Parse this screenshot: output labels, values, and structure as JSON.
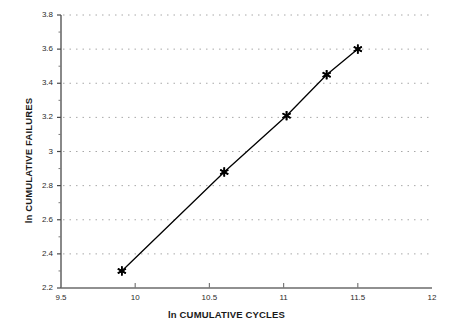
{
  "chart_data": {
    "type": "scatter",
    "title": "",
    "xlabel": "ln CUMULATIVE CYCLES",
    "ylabel": "ln CUMULATIVE FAILURES",
    "xlim": [
      9.5,
      12
    ],
    "ylim": [
      2.2,
      3.8
    ],
    "xticks": [
      "9.5",
      "10",
      "10.5",
      "11",
      "11.5",
      "12"
    ],
    "xtick_values": [
      9.5,
      10,
      10.5,
      11,
      11.5,
      12
    ],
    "yticks": [
      "2.2",
      "2.4",
      "2.6",
      "2.8",
      "3",
      "3.2",
      "3.4",
      "3.6",
      "3.8"
    ],
    "ytick_values": [
      2.2,
      2.4,
      2.6,
      2.8,
      3.0,
      3.2,
      3.4,
      3.6,
      3.8
    ],
    "grid": "horizontal-dotted",
    "legend": "none",
    "marker": "asterisk-star",
    "line_style": "solid-connected",
    "series": [
      {
        "name": "cumulative failures vs cycles",
        "x": [
          9.91,
          10.6,
          11.02,
          11.29,
          11.5
        ],
        "y": [
          2.3,
          2.88,
          3.21,
          3.45,
          3.6
        ],
        "color": "#000000"
      }
    ],
    "colors": {
      "line": "#000000",
      "marker": "#000000",
      "grid": "#a8a8a8",
      "axis": "#555555",
      "background": "#ffffff",
      "text": "#1a1a1a"
    }
  }
}
